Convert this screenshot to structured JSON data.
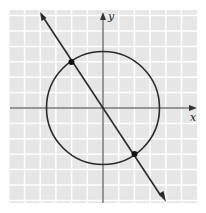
{
  "chart_data": {
    "type": "diagram",
    "axes": {
      "x_label": "x",
      "y_label": "y",
      "grid": true,
      "x_range": [
        -6,
        6
      ],
      "y_range": [
        -6,
        6
      ]
    },
    "circle": {
      "center": [
        0,
        0
      ],
      "radius": 3.606
    },
    "line": {
      "slope": -1.5,
      "intercept": 0,
      "arrows": "both"
    },
    "points": [
      {
        "x": -2,
        "y": 3
      },
      {
        "x": 2,
        "y": -3
      }
    ]
  },
  "labels": {
    "x": "x",
    "y": "y"
  },
  "colors": {
    "grid_bg": "#e6e6e6",
    "grid_line": "#ffffff",
    "ink": "#2a2a2a"
  }
}
